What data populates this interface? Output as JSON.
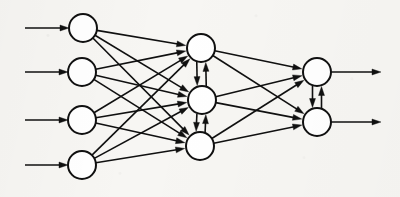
{
  "figure": {
    "background_color": "#f7f6f3",
    "stroke_color": "#101010",
    "node_fill_color": "#ffffff",
    "width": 400,
    "height": 197
  },
  "layers": [
    {
      "id": "input",
      "name": "input-layer",
      "node_count": 4,
      "node_radius": 14,
      "x": 83,
      "nodes": [
        {
          "id": "i1",
          "label": "",
          "cx": 83,
          "cy": 28
        },
        {
          "id": "i2",
          "label": "",
          "cx": 82,
          "cy": 72
        },
        {
          "id": "i3",
          "label": "",
          "cx": 82,
          "cy": 120
        },
        {
          "id": "i4",
          "label": "",
          "cx": 82,
          "cy": 165
        }
      ]
    },
    {
      "id": "hidden",
      "name": "hidden-layer",
      "node_count": 3,
      "node_radius": 14,
      "x": 201,
      "nodes": [
        {
          "id": "h1",
          "label": "",
          "cx": 201,
          "cy": 48
        },
        {
          "id": "h2",
          "label": "",
          "cx": 202,
          "cy": 100
        },
        {
          "id": "h3",
          "label": "",
          "cx": 200,
          "cy": 146
        }
      ]
    },
    {
      "id": "output",
      "name": "output-layer",
      "node_count": 2,
      "node_radius": 14,
      "x": 317,
      "nodes": [
        {
          "id": "o1",
          "label": "",
          "cx": 317,
          "cy": 72
        },
        {
          "id": "o2",
          "label": "",
          "cx": 317,
          "cy": 122
        }
      ]
    }
  ],
  "external_inputs": [
    {
      "id": "in-arrow-1",
      "x1": 25,
      "y1": 28,
      "x2": 83,
      "y2": 28
    },
    {
      "id": "in-arrow-2",
      "x1": 25,
      "y1": 72,
      "x2": 82,
      "y2": 72
    },
    {
      "id": "in-arrow-3",
      "x1": 25,
      "y1": 120,
      "x2": 82,
      "y2": 120
    },
    {
      "id": "in-arrow-4",
      "x1": 25,
      "y1": 165,
      "x2": 82,
      "y2": 165
    }
  ],
  "external_outputs": [
    {
      "id": "out-arrow-1",
      "x1": 317,
      "y1": 72,
      "x2": 381,
      "y2": 72
    },
    {
      "id": "out-arrow-2",
      "x1": 317,
      "y1": 122,
      "x2": 381,
      "y2": 122
    }
  ],
  "forward_edges": [
    {
      "id": "i1-h1",
      "from": "i1",
      "to": "h1"
    },
    {
      "id": "i1-h2",
      "from": "i1",
      "to": "h2"
    },
    {
      "id": "i1-h3",
      "from": "i1",
      "to": "h3"
    },
    {
      "id": "i2-h1",
      "from": "i2",
      "to": "h1"
    },
    {
      "id": "i2-h2",
      "from": "i2",
      "to": "h2"
    },
    {
      "id": "i2-h3",
      "from": "i2",
      "to": "h3"
    },
    {
      "id": "i3-h1",
      "from": "i3",
      "to": "h1"
    },
    {
      "id": "i3-h2",
      "from": "i3",
      "to": "h2"
    },
    {
      "id": "i3-h3",
      "from": "i3",
      "to": "h3"
    },
    {
      "id": "i4-h1",
      "from": "i4",
      "to": "h1"
    },
    {
      "id": "i4-h2",
      "from": "i4",
      "to": "h2"
    },
    {
      "id": "i4-h3",
      "from": "i4",
      "to": "h3"
    },
    {
      "id": "h1-o1",
      "from": "h1",
      "to": "o1"
    },
    {
      "id": "h1-o2",
      "from": "h1",
      "to": "o2"
    },
    {
      "id": "h2-o1",
      "from": "h2",
      "to": "o1"
    },
    {
      "id": "h2-o2",
      "from": "h2",
      "to": "o2"
    },
    {
      "id": "h3-o1",
      "from": "h3",
      "to": "o1"
    },
    {
      "id": "h3-o2",
      "from": "h3",
      "to": "o2"
    }
  ],
  "lateral_edges": [
    {
      "id": "h1-h2-lateral",
      "from": "h1",
      "to": "h2",
      "bidirectional": true
    },
    {
      "id": "h2-h3-lateral",
      "from": "h2",
      "to": "h3",
      "bidirectional": true
    },
    {
      "id": "o1-o2-lateral",
      "from": "o1",
      "to": "o2",
      "bidirectional": true
    }
  ],
  "style": {
    "edge_stroke_width": 1.6,
    "node_stroke_width": 2.0,
    "arrowhead_length": 9,
    "arrowhead_width": 6,
    "lateral_offset": 4.5
  }
}
